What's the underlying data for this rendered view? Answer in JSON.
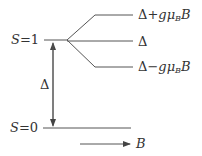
{
  "diagram": {
    "title": "",
    "levels": [
      {
        "name": "S=1",
        "label_var": "S",
        "label_eq": "=",
        "label_val": "1"
      },
      {
        "name": "S=0",
        "label_var": "S",
        "label_eq": "=",
        "label_val": "0"
      }
    ],
    "zeeman_levels": [
      {
        "base": "Δ",
        "op": "+",
        "g": "g",
        "mu": "μ",
        "sub": "B",
        "field": "B"
      },
      {
        "base": "Δ"
      },
      {
        "base": "Δ",
        "op": "−",
        "g": "g",
        "mu": "μ",
        "sub": "B",
        "field": "B"
      }
    ],
    "gap_label": "Δ",
    "field_arrow_label": "B",
    "line_color": "#444444"
  }
}
